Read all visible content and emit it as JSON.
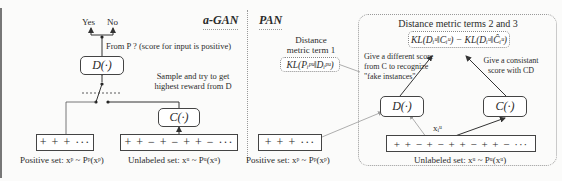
{
  "agan": {
    "title": "a-GAN",
    "yes_label": "Yes",
    "no_label": "No",
    "from_p_note": "From P ? (score for input is positive)",
    "discriminator": "D(·)",
    "classifier": "C(·)",
    "sample_note_line1": "Sample and try to get",
    "sample_note_line2": "highest reward from D",
    "positive_seq": "+ + + ···",
    "unlabeled_seq": "+ + − + − + + − ···",
    "positive_caption": "Positive set: xᵖ ~ Pᵖ(xᵖ)",
    "unlabeled_caption": "Unlabeled set: xᵘ ~ Pᵘ(xᵘ)"
  },
  "pan": {
    "title": "PAN",
    "metric1_line1": "Distance",
    "metric1_line2": "metric term 1",
    "metric1_formula": "KL(Pᵢᵖᵘ‖Dᵢᵖᵘ)",
    "metric23_title": "Distance metric terms 2 and 3",
    "metric23_formula": "KL(Dᵢᵘ‖Cᵢᵘ) − KL(Dᵢᵘ‖Ĉᵢᵘ)",
    "note_d_line1": "Give a different score",
    "note_d_line2": "from C to recognize",
    "note_d_line3": "\"fake instances\"",
    "note_c_line1": "Give a consistant",
    "note_c_line2": "score with CD",
    "discriminator": "D(·)",
    "classifier": "C(·)",
    "sample_label": "xᵢᵘ",
    "positive_seq": "+ + + ···",
    "unlabeled_seq": "+ + − + − + + − + + − ···",
    "positive_caption": "Positive set: xᵖ ~ Pᵖ(xᵖ)",
    "unlabeled_caption": "Unlabeled set: xᵘ ~ Pᵘ(xᵘ)"
  }
}
